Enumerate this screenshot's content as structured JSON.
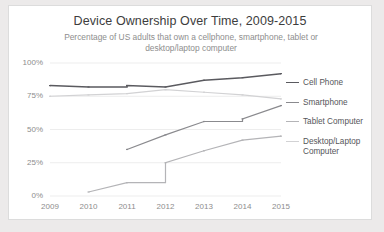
{
  "card": {
    "background": "#ffffff",
    "border_color": "#dcdcdc",
    "page_background": "#eceaea"
  },
  "chart_data": {
    "type": "line",
    "title": "Device Ownership Over Time, 2009-2015",
    "subtitle": "Percentage of US adults that own a cellphone, smartphone, tablet or desktop/laptop computer",
    "xlabel": "",
    "ylabel": "",
    "x": [
      2009,
      2010,
      2011,
      2012,
      2013,
      2014,
      2015
    ],
    "categories": [
      "2009",
      "2010",
      "2011",
      "2012",
      "2013",
      "2014",
      "2015"
    ],
    "xtick_labels": [
      "2009",
      "2010",
      "2011",
      "2012",
      "2013",
      "2014",
      "2015"
    ],
    "ytick_labels": [
      "0%",
      "25%",
      "50%",
      "75%",
      "100%"
    ],
    "ytick_values": [
      0,
      25,
      50,
      75,
      100
    ],
    "ylim": [
      0,
      100
    ],
    "xlim": [
      2009,
      2015
    ],
    "grid": true,
    "grid_axis": "y",
    "legend_position": "right",
    "series": [
      {
        "name": "Cell Phone",
        "color": "#5a5a5f",
        "values": [
          83,
          82,
          83,
          82,
          87,
          89,
          92
        ],
        "step_at": [
          2011
        ]
      },
      {
        "name": "Smartphone",
        "color": "#8a8a8e",
        "values": [
          null,
          null,
          35,
          46,
          56,
          58,
          68
        ],
        "step_at": [
          2014
        ]
      },
      {
        "name": "Tablet Computer",
        "color": "#b4b4b7",
        "values": [
          null,
          3,
          10,
          25,
          34,
          42,
          45
        ],
        "step_at": [
          2012
        ]
      },
      {
        "name": "Desktop/Laptop Computer",
        "color": "#d2d2d4",
        "values": [
          75,
          76,
          77,
          80,
          78,
          76,
          73
        ],
        "step_at": []
      }
    ]
  },
  "legend": {
    "items": [
      {
        "label": "Cell Phone",
        "color": "#5a5a5f"
      },
      {
        "label": "Smartphone",
        "color": "#8a8a8e"
      },
      {
        "label": "Tablet Computer",
        "color": "#b4b4b7"
      },
      {
        "label": "Desktop/Laptop Computer",
        "color": "#d2d2d4"
      }
    ]
  },
  "axis": {
    "y_labels": [
      "100%",
      "75%",
      "50%",
      "25%",
      "0%"
    ],
    "x_labels": [
      "2009",
      "2010",
      "2011",
      "2012",
      "2013",
      "2014",
      "2015"
    ]
  }
}
